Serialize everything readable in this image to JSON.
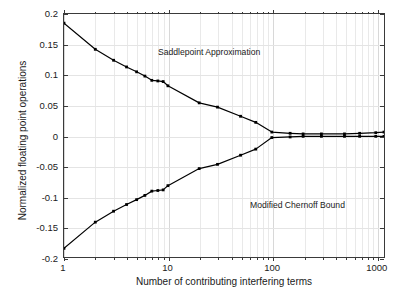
{
  "chart_data": {
    "type": "line",
    "title": "",
    "xlabel": "Number of contributing interfering terms",
    "ylabel": "Normalized floating point operations",
    "xscale": "log",
    "yscale": "linear",
    "xlim": [
      1,
      1200
    ],
    "ylim": [
      -0.2,
      0.2
    ],
    "grid": true,
    "legend_position": "in-plot annotations",
    "xticks": [
      1,
      10,
      100,
      1000
    ],
    "xticklabels": [
      "1",
      "10",
      "100",
      "1000"
    ],
    "yticks": [
      0.2,
      0.15,
      0.1,
      0.05,
      0,
      -0.05,
      -0.1,
      -0.15,
      -0.2
    ],
    "yticklabels": [
      "0.2",
      "0.15",
      "0.1",
      "0.05",
      "0",
      "-0.05",
      "-0.1",
      "-0.15",
      "-0.2"
    ],
    "annotations": [
      {
        "text": "Saddlepoint Approximation",
        "x": 2.0,
        "y": 0.163
      },
      {
        "text": "Modified Chernoff Bound",
        "x": 22,
        "y": -0.088
      }
    ],
    "series": [
      {
        "name": "Saddlepoint Approximation",
        "color": "#000000",
        "marker": "square",
        "x": [
          1,
          2,
          3,
          4,
          5,
          6,
          7,
          8,
          9,
          10,
          20,
          30,
          50,
          70,
          100,
          150,
          200,
          300,
          500,
          700,
          1000,
          1200
        ],
        "values": [
          0.185,
          0.142,
          0.124,
          0.113,
          0.105,
          0.098,
          0.091,
          0.09,
          0.089,
          0.082,
          0.054,
          0.047,
          0.032,
          0.022,
          0.006,
          0.004,
          0.003,
          0.003,
          0.003,
          0.004,
          0.005,
          0.006
        ]
      },
      {
        "name": "Modified Chernoff Bound",
        "color": "#000000",
        "marker": "square",
        "x": [
          1,
          2,
          3,
          4,
          5,
          6,
          7,
          8,
          9,
          10,
          20,
          30,
          50,
          70,
          100,
          150,
          200,
          300,
          500,
          700,
          1000,
          1200
        ],
        "values": [
          -0.185,
          -0.142,
          -0.124,
          -0.113,
          -0.105,
          -0.098,
          -0.091,
          -0.09,
          -0.089,
          -0.082,
          -0.054,
          -0.047,
          -0.032,
          -0.022,
          -0.003,
          -0.002,
          -0.001,
          -0.001,
          -0.001,
          -0.001,
          -0.001,
          -0.001
        ]
      }
    ]
  }
}
